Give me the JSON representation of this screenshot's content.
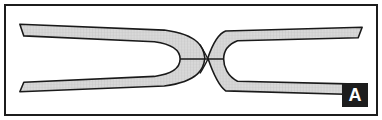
{
  "figure": {
    "panel_label": "A",
    "frame": {
      "border_color": "#1c1c1c",
      "background_color": "#ffffff",
      "border_width_px": 2
    },
    "label_badge": {
      "text": "A",
      "background_color": "#1d1d1d",
      "text_color": "#ffffff",
      "position": "bottom-right"
    },
    "drawing": {
      "description": "Two bifurcated band-shaped structures meeting at a central crossing point",
      "outline_color": "#1a1a1a",
      "fill_color": "#d6d6d6",
      "hatch_color": "#b8b8b8",
      "stroke_width_px": 1.6,
      "elements": [
        {
          "name": "left-fork-band",
          "shape": "fork",
          "opening_direction": "left",
          "slot_fill": "#ffffff"
        },
        {
          "name": "right-fork-band",
          "shape": "fork",
          "opening_direction": "right",
          "slot_fill": "#ffffff"
        },
        {
          "name": "central-crossing-node",
          "shape": "point",
          "x": 204,
          "y": 55
        },
        {
          "name": "median-line",
          "shape": "line"
        }
      ]
    }
  }
}
